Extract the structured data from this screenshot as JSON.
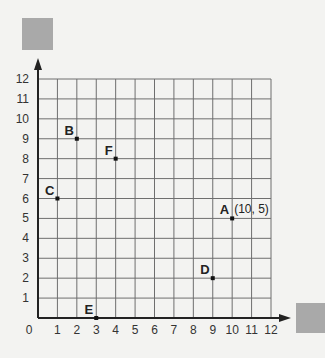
{
  "chart_data": {
    "type": "scatter",
    "title": "",
    "xlabel": "",
    "ylabel": "",
    "xlim": [
      0,
      12
    ],
    "ylim": [
      0,
      12
    ],
    "grid": true,
    "x_ticks": [
      "0",
      "1",
      "2",
      "3",
      "4",
      "5",
      "6",
      "7",
      "8",
      "9",
      "10",
      "11",
      "12"
    ],
    "y_ticks": [
      "1",
      "2",
      "3",
      "4",
      "5",
      "6",
      "7",
      "8",
      "9",
      "10",
      "11",
      "12"
    ],
    "points": [
      {
        "label": "A",
        "x": 10,
        "y": 5,
        "annotation": "(10, 5)"
      },
      {
        "label": "B",
        "x": 2,
        "y": 9,
        "annotation": ""
      },
      {
        "label": "C",
        "x": 1,
        "y": 6,
        "annotation": ""
      },
      {
        "label": "D",
        "x": 9,
        "y": 2,
        "annotation": ""
      },
      {
        "label": "E",
        "x": 3,
        "y": 0,
        "annotation": ""
      },
      {
        "label": "F",
        "x": 4,
        "y": 8,
        "annotation": ""
      }
    ]
  },
  "colors": {
    "grid": "#6e6e6e",
    "axis": "#222222",
    "placeholder_box": "#a9a9a9"
  }
}
